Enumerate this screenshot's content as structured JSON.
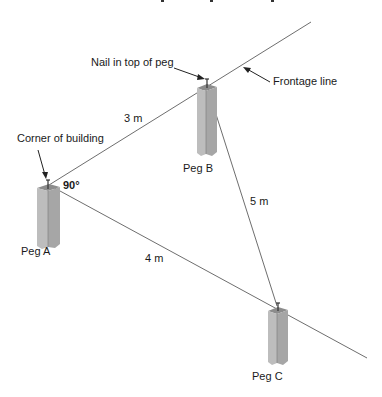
{
  "diagram": {
    "labels": {
      "nail": "Nail in top of peg",
      "frontage": "Frontage line",
      "corner": "Corner of building",
      "angle": "90°",
      "side_ab": "3 m",
      "side_bc": "5 m",
      "side_ac": "4 m",
      "peg_a": "Peg A",
      "peg_b": "Peg B",
      "peg_c": "Peg C"
    },
    "colors": {
      "line": "#6e6e6e",
      "peg_front": "#b9b9b9",
      "peg_side": "#a3a3a3",
      "peg_top": "#8c8c8c",
      "text": "#1a1a1a"
    }
  }
}
